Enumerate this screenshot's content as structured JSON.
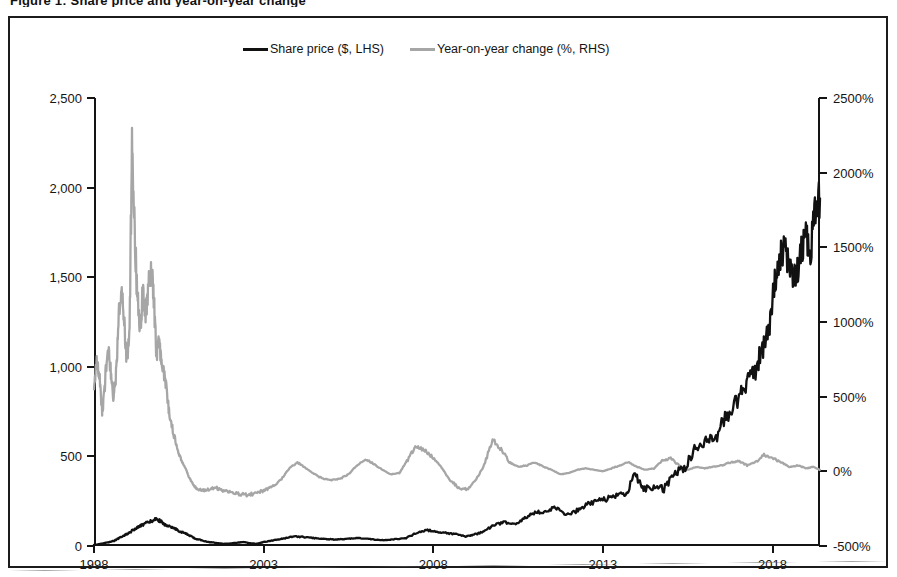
{
  "caption": {
    "text": "Figure 1: Share price and year-on-year change"
  },
  "legend": {
    "position": "top-center",
    "items": [
      {
        "label": "Share price ($, LHS)",
        "color": "#111111",
        "name": "share-price"
      },
      {
        "label": "Year-on-year change (%, RHS)",
        "color": "#a6a6a6",
        "name": "yoy-change"
      }
    ]
  },
  "axes": {
    "left": {
      "ticks": [
        "0",
        "500",
        "1,000",
        "1,500",
        "2,000",
        "2,500"
      ],
      "values": [
        0,
        500,
        1000,
        1500,
        2000,
        2500
      ],
      "min": 0,
      "max": 2500
    },
    "right": {
      "ticks": [
        "-500%",
        "0%",
        "500%",
        "1000%",
        "1500%",
        "2000%",
        "2500%"
      ],
      "values": [
        -500,
        0,
        500,
        1000,
        1500,
        2000,
        2500
      ],
      "min": -500,
      "max": 2500
    },
    "bottom": {
      "ticks": [
        "1998",
        "2003",
        "2008",
        "2013",
        "2018"
      ],
      "values": [
        1998,
        2003,
        2008,
        2013,
        2018
      ],
      "min": 1998,
      "max": 2019.4
    }
  },
  "chart_data": {
    "type": "line",
    "title": "Share price and year-on-year change",
    "xlabel": "",
    "ylabel": "Share price ($)",
    "y2label": "Year-on-year change (%)",
    "xlim": [
      1998,
      2019.4
    ],
    "ylim": [
      0,
      2500
    ],
    "y2lim": [
      -500,
      2500
    ],
    "grid": false,
    "legend_position": "top-center",
    "x_tick_labels": [
      "1998",
      "2003",
      "2008",
      "2013",
      "2018"
    ],
    "y_tick_labels": [
      "0",
      "500",
      "1,000",
      "1,500",
      "2,000",
      "2,500"
    ],
    "y2_tick_labels": [
      "-500%",
      "0%",
      "500%",
      "1000%",
      "1500%",
      "2000%",
      "2500%"
    ],
    "series": [
      {
        "name": "Share price ($, LHS)",
        "axis": "left",
        "color": "#111111",
        "unit": "$",
        "x": [
          1998.0,
          1998.15,
          1998.3,
          1998.45,
          1998.6,
          1998.75,
          1998.9,
          1999.05,
          1999.2,
          1999.35,
          1999.5,
          1999.65,
          1999.8,
          1999.95,
          2000.1,
          2000.25,
          2000.4,
          2000.55,
          2000.7,
          2000.85,
          2001.0,
          2001.2,
          2001.4,
          2001.6,
          2001.8,
          2002.0,
          2002.2,
          2002.4,
          2002.6,
          2002.8,
          2003.0,
          2003.3,
          2003.6,
          2003.9,
          2004.2,
          2004.5,
          2004.8,
          2005.1,
          2005.4,
          2005.7,
          2006.0,
          2006.3,
          2006.6,
          2006.9,
          2007.2,
          2007.5,
          2007.8,
          2008.1,
          2008.4,
          2008.7,
          2008.95,
          2009.2,
          2009.5,
          2009.8,
          2010.1,
          2010.4,
          2010.7,
          2011.0,
          2011.3,
          2011.6,
          2011.9,
          2012.2,
          2012.5,
          2012.8,
          2013.1,
          2013.4,
          2013.7,
          2013.95,
          2014.2,
          2014.5,
          2014.8,
          2015.1,
          2015.4,
          2015.7,
          2016.0,
          2016.3,
          2016.6,
          2016.9,
          2017.1,
          2017.3,
          2017.5,
          2017.7,
          2017.9,
          2018.05,
          2018.2,
          2018.35,
          2018.5,
          2018.65,
          2018.8,
          2018.95,
          2019.1,
          2019.25,
          2019.4
        ],
        "y": [
          6,
          10,
          16,
          22,
          30,
          45,
          60,
          75,
          95,
          110,
          125,
          135,
          150,
          140,
          120,
          105,
          95,
          80,
          70,
          55,
          40,
          30,
          22,
          18,
          12,
          14,
          18,
          22,
          16,
          12,
          22,
          32,
          42,
          53,
          50,
          44,
          40,
          36,
          38,
          44,
          42,
          36,
          32,
          39,
          44,
          72,
          90,
          78,
          72,
          66,
          52,
          62,
          84,
          118,
          132,
          118,
          155,
          184,
          196,
          214,
          173,
          194,
          228,
          252,
          262,
          280,
          298,
          398,
          318,
          332,
          318,
          404,
          432,
          536,
          586,
          592,
          716,
          790,
          856,
          948,
          988,
          1100,
          1190,
          1450,
          1580,
          1690,
          1540,
          1498,
          1580,
          1760,
          1620,
          1900,
          1940
        ]
      },
      {
        "name": "Year-on-year change (%, RHS)",
        "axis": "right",
        "color": "#a6a6a6",
        "unit": "%",
        "x": [
          1998.0,
          1998.08,
          1998.16,
          1998.24,
          1998.32,
          1998.4,
          1998.48,
          1998.56,
          1998.64,
          1998.72,
          1998.8,
          1998.88,
          1998.96,
          1999.04,
          1999.12,
          1999.2,
          1999.28,
          1999.36,
          1999.44,
          1999.52,
          1999.6,
          1999.68,
          1999.76,
          1999.84,
          1999.92,
          2000.0,
          2000.1,
          2000.2,
          2000.3,
          2000.4,
          2000.5,
          2000.6,
          2000.7,
          2000.8,
          2000.9,
          2001.0,
          2001.2,
          2001.4,
          2001.6,
          2001.8,
          2002.0,
          2002.25,
          2002.5,
          2002.75,
          2003.0,
          2003.25,
          2003.5,
          2003.75,
          2004.0,
          2004.25,
          2004.5,
          2004.75,
          2005.0,
          2005.25,
          2005.5,
          2005.75,
          2006.0,
          2006.25,
          2006.5,
          2006.75,
          2007.0,
          2007.25,
          2007.5,
          2007.75,
          2008.0,
          2008.25,
          2008.5,
          2008.75,
          2009.0,
          2009.25,
          2009.5,
          2009.75,
          2010.0,
          2010.25,
          2010.5,
          2010.75,
          2011.0,
          2011.25,
          2011.5,
          2011.75,
          2012.0,
          2012.25,
          2012.5,
          2012.75,
          2013.0,
          2013.25,
          2013.5,
          2013.75,
          2014.0,
          2014.25,
          2014.5,
          2014.75,
          2015.0,
          2015.25,
          2015.5,
          2015.75,
          2016.0,
          2016.25,
          2016.5,
          2016.75,
          2017.0,
          2017.25,
          2017.5,
          2017.75,
          2018.0,
          2018.25,
          2018.5,
          2018.75,
          2019.0,
          2019.2,
          2019.4
        ],
        "y": [
          560,
          720,
          640,
          400,
          560,
          860,
          700,
          480,
          620,
          980,
          1240,
          1040,
          760,
          900,
          2140,
          1580,
          1160,
          940,
          1220,
          1060,
          1220,
          1380,
          1180,
          780,
          880,
          700,
          620,
          420,
          300,
          200,
          120,
          60,
          20,
          -40,
          -80,
          -110,
          -130,
          -120,
          -110,
          -130,
          -140,
          -150,
          -160,
          -150,
          -130,
          -100,
          -60,
          20,
          60,
          20,
          -20,
          -50,
          -60,
          -50,
          -20,
          40,
          80,
          50,
          10,
          -20,
          -10,
          80,
          170,
          140,
          90,
          20,
          -60,
          -110,
          -120,
          -60,
          40,
          210,
          150,
          60,
          30,
          40,
          60,
          30,
          10,
          -20,
          -10,
          10,
          20,
          10,
          0,
          20,
          40,
          60,
          30,
          10,
          20,
          70,
          90,
          40,
          10,
          30,
          20,
          30,
          40,
          60,
          70,
          40,
          60,
          110,
          90,
          60,
          30,
          40,
          20,
          30,
          10
        ]
      }
    ]
  }
}
